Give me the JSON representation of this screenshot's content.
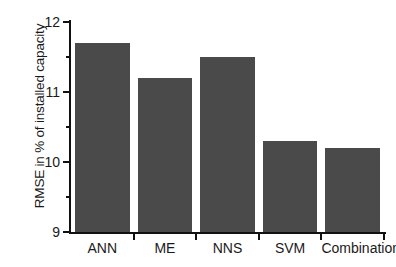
{
  "chart_data": {
    "type": "bar",
    "title": "",
    "subtitle": "",
    "xlabel": "",
    "ylabel": "RMSE in % of installed capacity",
    "categories": [
      "ANN",
      "ME",
      "NNS",
      "SVM",
      "Combination"
    ],
    "values": [
      11.7,
      11.2,
      11.5,
      10.3,
      10.2
    ],
    "ylim": [
      9,
      12
    ],
    "ytick_labels": [
      "9",
      "10",
      "11",
      "12"
    ],
    "ytick_values": [
      9,
      10,
      11,
      12
    ],
    "yminor_tick_values": [
      9.5,
      10.5,
      11.5
    ],
    "grid": false,
    "legend": null,
    "legend_position": "none",
    "bar_color": "#4a4a4a",
    "axis_color": "#111111",
    "background_color": "#ffffff",
    "series": [
      {
        "name": "RMSE",
        "values": [
          11.7,
          11.2,
          11.5,
          10.3,
          10.2
        ]
      }
    ],
    "annotations": []
  },
  "axes": {
    "y_title": "RMSE in % of installed capacity",
    "ticks": [
      {
        "label": "12",
        "value": 12
      },
      {
        "label": "11",
        "value": 11
      },
      {
        "label": "10",
        "value": 10
      },
      {
        "label": "9",
        "value": 9
      }
    ]
  },
  "bars": [
    {
      "label": "ANN",
      "value": 11.7
    },
    {
      "label": "ME",
      "value": 11.2
    },
    {
      "label": "NNS",
      "value": 11.5
    },
    {
      "label": "SVM",
      "value": 10.3
    },
    {
      "label": "Combination",
      "value": 10.2
    }
  ]
}
